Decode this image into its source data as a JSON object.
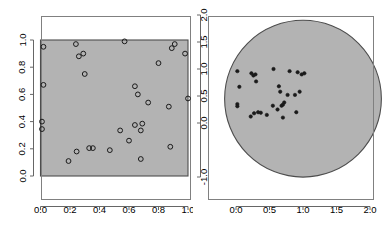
{
  "figure": {
    "background": "#ffffff",
    "region_fill": "#b3b3b3",
    "region_stroke": "#4d4d4d",
    "point_stroke": "#1a1a1a",
    "axis_color": "#666666",
    "box_color": "#808080"
  },
  "chart_data": [
    {
      "type": "scatter",
      "title": "",
      "xlabel": "",
      "ylabel": "",
      "xlim": [
        -0.04,
        1.04
      ],
      "ylim": [
        -0.12,
        1.12
      ],
      "xticks": [
        0.0,
        0.2,
        0.4,
        0.6,
        0.8,
        1.0
      ],
      "xticklabels": [
        "0.0",
        "0.2",
        "0.4",
        "0.6",
        "0.8",
        "1.0"
      ],
      "yticks": [
        0.0,
        0.2,
        0.4,
        0.6,
        0.8,
        1.0
      ],
      "yticklabels": [
        "0.0",
        "0.2",
        "0.4",
        "0.6",
        "0.8",
        "1.0"
      ],
      "grid": false,
      "legend": null,
      "marker": "open-circle",
      "region": {
        "shape": "rectangle",
        "x0": 0.0,
        "y0": 0.0,
        "x1": 1.0,
        "y1": 1.0
      },
      "x": [
        0.02,
        0.02,
        0.01,
        0.01,
        0.19,
        0.245,
        0.24,
        0.26,
        0.29,
        0.3,
        0.33,
        0.47,
        0.54,
        0.57,
        0.6,
        0.64,
        0.64,
        0.66,
        0.68,
        0.68,
        0.69,
        0.73,
        0.8,
        0.87,
        0.88,
        0.89,
        0.91,
        1.0,
        0.98,
        0.355
      ],
      "y": [
        0.95,
        0.67,
        0.4,
        0.345,
        0.11,
        0.18,
        0.97,
        0.88,
        0.9,
        0.75,
        0.205,
        0.19,
        0.335,
        0.99,
        0.26,
        0.66,
        0.375,
        0.6,
        0.335,
        0.125,
        0.385,
        0.54,
        0.83,
        0.51,
        0.215,
        0.94,
        0.97,
        0.57,
        0.9,
        0.205
      ]
    },
    {
      "type": "scatter",
      "title": "",
      "xlabel": "",
      "ylabel": "",
      "xlim": [
        -0.3,
        2.3
      ],
      "ylim": [
        -1.25,
        2.1
      ],
      "xticks": [
        0.0,
        0.5,
        1.0,
        1.5,
        2.0
      ],
      "xticklabels": [
        "0.0",
        "0.5",
        "1.0",
        "1.5",
        "2.0"
      ],
      "yticks": [
        -1.0,
        0.0,
        0.5,
        1.0,
        1.5,
        2.0
      ],
      "yticklabels": [
        "-1.0",
        "0.0",
        "0.5",
        "1.0",
        "1.5",
        "2.0"
      ],
      "grid": false,
      "legend": null,
      "marker": "filled-circle",
      "region": {
        "shape": "circle",
        "cx": 1.0,
        "cy": 0.45,
        "r": 1.17
      },
      "x": [
        0.02,
        0.05,
        0.02,
        0.02,
        0.22,
        0.27,
        0.23,
        0.26,
        0.29,
        0.3,
        0.33,
        0.46,
        0.55,
        0.56,
        0.62,
        0.64,
        0.66,
        0.68,
        0.7,
        0.7,
        0.72,
        0.77,
        0.8,
        0.88,
        0.9,
        0.92,
        0.95,
        1.02,
        0.98,
        0.37
      ],
      "y": [
        0.96,
        0.67,
        0.35,
        0.31,
        0.12,
        0.18,
        0.92,
        0.88,
        0.9,
        0.77,
        0.2,
        0.15,
        0.32,
        1.0,
        0.25,
        0.68,
        0.58,
        0.32,
        0.34,
        0.1,
        0.38,
        0.52,
        0.96,
        0.52,
        0.2,
        0.94,
        0.58,
        0.92,
        0.9,
        0.19
      ]
    }
  ]
}
